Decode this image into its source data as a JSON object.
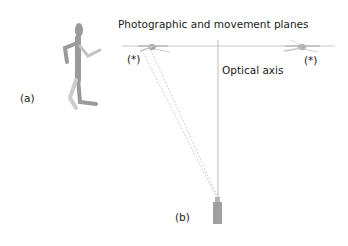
{
  "diagram": {
    "labels": {
      "planes": "Photographic and movement planes",
      "optical_axis": "Optical axis",
      "marker_left": "(*)",
      "marker_right": "(*)",
      "panel_a": "(a)",
      "panel_b": "(b)"
    },
    "colors": {
      "figure": "#9a9a9a",
      "lines": "#c8c8c8",
      "camera": "#a0a0a0",
      "text": "#1a1a1a"
    }
  }
}
